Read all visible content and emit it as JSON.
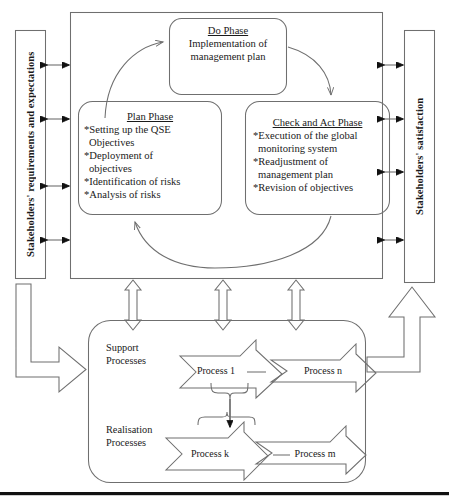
{
  "diagram": {
    "title_hidden": "",
    "side_labels": {
      "left": "Stakeholders' requirements and expectations",
      "right": "Stakeholders' satisfaction"
    },
    "pdca": {
      "do": {
        "title": "Do Phase",
        "lines": "Implementation of\nmanagement plan"
      },
      "plan": {
        "title": "Plan Phase",
        "bullets": [
          "*Setting up the QSE\n Objectives",
          "*Deployment of\nobjectives",
          "*Identification of risks",
          "*Analysis of risks"
        ]
      },
      "check": {
        "title": "Check and Act Phase",
        "bullets": [
          "*Execution of the global\n monitoring system",
          "*Readjustment of\n management plan",
          "*Revision of objectives"
        ]
      }
    },
    "processes": {
      "support_label": "Support\nProcesses",
      "realisation_label": "Realisation\nProcesses",
      "support_items": [
        "Process 1",
        "Process n"
      ],
      "realisation_items": [
        "Process k",
        "Process m"
      ]
    },
    "icons": {
      "cycle_arrow": "curved-cycle-arrow",
      "link_arrow": "double-headed-arrow",
      "input_arrow": "elbow-block-arrow-right",
      "output_arrow": "elbow-block-arrow-up",
      "chevron": "chevron-block-arrow"
    },
    "colors": {
      "stroke": "#6f6f6f",
      "text": "#1a1a1a",
      "bottom_bar": "#111111",
      "background": "#ffffff"
    }
  }
}
